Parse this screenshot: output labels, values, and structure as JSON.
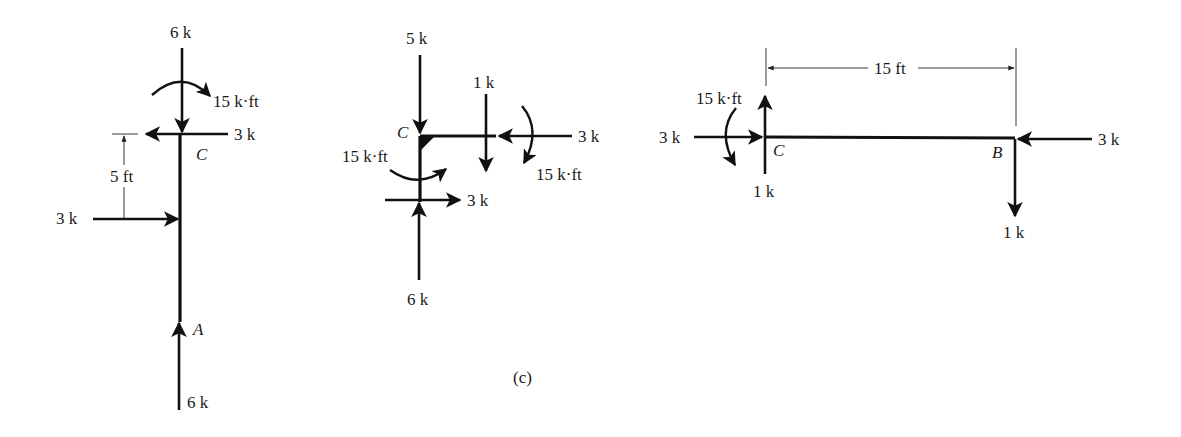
{
  "figure": {
    "caption": "(c)",
    "free_body_diagrams": [
      {
        "id": "column_AC",
        "orientation": "vertical",
        "points": [
          "C",
          "A"
        ],
        "labels": {
          "top_force": "6 k",
          "top_moment": "15 k·ft",
          "top_horizontal": "3 k",
          "point_c": "C",
          "dimension": "5 ft",
          "side_force": "3 k",
          "point_a": "A",
          "bottom_force": "6 k"
        }
      },
      {
        "id": "joint_C",
        "orientation": "corner",
        "points": [
          "C"
        ],
        "labels": {
          "top_force": "5 k",
          "beam_shear": "1 k",
          "beam_axial": "3 k",
          "beam_moment": "15 k·ft",
          "point_c": "C",
          "column_moment": "15 k·ft",
          "column_horizontal": "3 k",
          "bottom_force": "6 k"
        }
      },
      {
        "id": "beam_CB",
        "orientation": "horizontal",
        "points": [
          "C",
          "B"
        ],
        "labels": {
          "dimension": "15 ft",
          "moment": "15 k·ft",
          "left_axial": "3 k",
          "point_c": "C",
          "left_shear": "1 k",
          "point_b": "B",
          "right_axial": "3 k",
          "right_shear": "1 k"
        }
      }
    ]
  }
}
